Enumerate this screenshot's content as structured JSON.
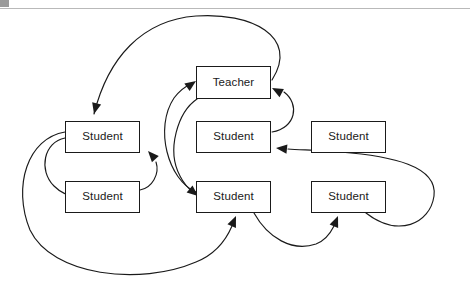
{
  "page": {
    "background_color": "#ffffff",
    "line_color": "#1a1a1a",
    "rule_color": "#b9b9b9",
    "width": 470,
    "height": 287
  },
  "header": {
    "rule_name": "horizontal-rule",
    "corner_mark_name": "page-corner-mark"
  },
  "diagram": {
    "type": "sociogram",
    "title": "",
    "nodes": [
      {
        "id": "teacher",
        "label": "Teacher",
        "x": 196,
        "y": 66,
        "w": 75,
        "h": 33
      },
      {
        "id": "student_1",
        "label": "Student",
        "x": 65,
        "y": 121,
        "w": 75,
        "h": 32
      },
      {
        "id": "student_2",
        "label": "Student",
        "x": 196,
        "y": 121,
        "w": 75,
        "h": 32
      },
      {
        "id": "student_3",
        "label": "Student",
        "x": 311,
        "y": 121,
        "w": 75,
        "h": 32
      },
      {
        "id": "student_4",
        "label": "Student",
        "x": 65,
        "y": 181,
        "w": 75,
        "h": 32
      },
      {
        "id": "student_5",
        "label": "Student",
        "x": 196,
        "y": 181,
        "w": 75,
        "h": 32
      },
      {
        "id": "student_6",
        "label": "Student",
        "x": 311,
        "y": 181,
        "w": 75,
        "h": 32
      }
    ],
    "edges": [
      {
        "from": "teacher",
        "to": "student_1",
        "path": "M 272 80 C 300 36 250 12 196 16 C 142 20 108 58 94 114",
        "arrow_at": [
          94,
          114
        ],
        "arrow_angle": 104
      },
      {
        "from": "student_2",
        "to": "teacher",
        "path": "M 272 132 C 296 128 300 104 284 92",
        "arrow_at": [
          272,
          88
        ],
        "arrow_angle": 208
      },
      {
        "from": "student_5",
        "to": "teacher",
        "path": "M 196 192 C 168 180 154 128 174 98 C 180 90 186 86 192 83",
        "arrow_at": [
          196,
          81
        ],
        "arrow_angle": 325
      },
      {
        "from": "teacher",
        "to": "student_5",
        "path": "M 197 99 C 178 112 166 150 180 176 C 184 184 189 189 193 192",
        "arrow_at": [
          198,
          196
        ],
        "arrow_angle": 40
      },
      {
        "from": "student_4",
        "to": "student_1",
        "path": "M 140 190 C 152 188 160 174 156 162",
        "arrow_at": [
          148,
          151
        ],
        "arrow_angle": 228
      },
      {
        "from": "student_1",
        "to": "student_4",
        "path": "M 65 138 C 44 142 38 170 54 186 C 62 194 70 196 76 196",
        "arrow_at": [
          84,
          196
        ],
        "arrow_angle": 2
      },
      {
        "from": "student_1",
        "to": "student_5",
        "path": "M 65 132 C 28 138 12 186 30 230 C 52 276 140 286 196 262 C 216 254 226 240 232 226",
        "arrow_at": [
          236,
          216
        ],
        "arrow_angle": 293
      },
      {
        "from": "student_5",
        "to": "student_6",
        "path": "M 254 213 C 268 238 292 252 316 244 C 324 241 330 234 334 226",
        "arrow_at": [
          338,
          216
        ],
        "arrow_angle": 292
      },
      {
        "from": "student_6",
        "to": "student_2",
        "path": "M 366 213 C 398 238 430 224 434 196 C 438 166 392 156 340 152 C 318 150 300 150 288 149",
        "arrow_at": [
          276,
          148
        ],
        "arrow_angle": 186
      }
    ]
  }
}
